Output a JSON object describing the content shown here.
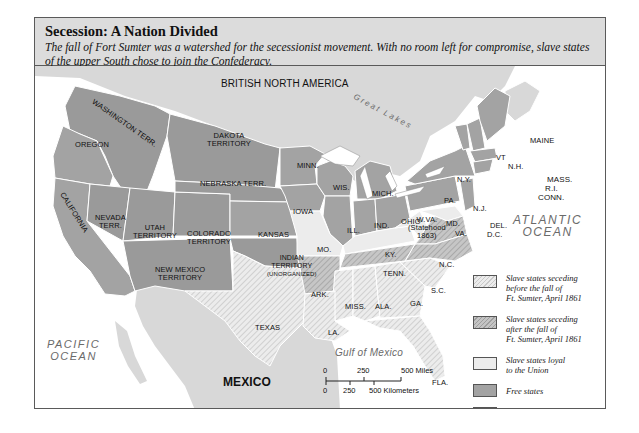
{
  "header": {
    "title": "Secession: A Nation Divided",
    "subtitle": "The fall of Fort Sumter was a watershed for the secessionist movement. With no room left for compromise, slave states of the upper South chose to join the Confederacy."
  },
  "regions": {
    "british_north_america": "BRITISH NORTH AMERICA",
    "great_lakes": "Great Lakes",
    "mexico": "MEXICO",
    "pacific_ocean": [
      "PACIFIC",
      "OCEAN"
    ],
    "atlantic_ocean": [
      "ATLANTIC",
      "OCEAN"
    ],
    "gulf_of_mexico": "Gulf of Mexico"
  },
  "states": {
    "washington": "WASHINGTON TERR.",
    "oregon": "OREGON",
    "california": "CALIFORNIA",
    "nevada": [
      "NEVADA",
      "TERR."
    ],
    "utah": [
      "UTAH",
      "TERRITORY"
    ],
    "colorado": [
      "COLORADO",
      "TERRITORY"
    ],
    "dakota": [
      "DAKOTA",
      "TERRITORY"
    ],
    "nebraska": "NEBRASKA TERR.",
    "kansas": "KANSAS",
    "new_mexico": [
      "NEW MEXICO",
      "TERRITORY"
    ],
    "indian": [
      "INDIAN",
      "TERRITORY",
      "(UNORGANIZED)"
    ],
    "texas": "TEXAS",
    "minn": "MINN.",
    "iowa": "IOWA",
    "mo": "MO.",
    "ark": "ARK.",
    "la": "LA.",
    "wis": "WIS.",
    "ill": "ILL.",
    "mich": "MICH.",
    "ind": "IND.",
    "ohio": "OHIO",
    "ky": "KY.",
    "tenn": "TENN.",
    "miss": "MISS.",
    "ala": "ALA.",
    "ga": "GA.",
    "fla": "FLA.",
    "sc": "S.C.",
    "nc": "N.C.",
    "va": "VA.",
    "wva": [
      "W.VA.",
      "(Statehood",
      "1863)"
    ],
    "md": "MD.",
    "del": "DEL.",
    "dc": "D.C.",
    "pa": "PA.",
    "nj": "N.J.",
    "ny": "N.Y.",
    "vt": "VT",
    "nh": "N.H.",
    "maine": "MAINE",
    "mass": "MASS.",
    "ri": "R.I.",
    "conn": "CONN."
  },
  "legend": {
    "items": [
      {
        "label": "Slave states seceding before the fall of Ft. Sumter, April 1861",
        "lines": [
          "Slave states seceding",
          "before the fall of",
          "Ft. Sumter, April 1861"
        ],
        "pattern": "light-hatch"
      },
      {
        "label": "Slave states seceding after the fall of Ft. Sumter, April 1861",
        "lines": [
          "Slave states seceding",
          "after the fall of",
          "Ft. Sumter, April 1861"
        ],
        "pattern": "dark-hatch"
      },
      {
        "label": "Slave states loyal to the Union",
        "lines": [
          "Slave states loyal",
          "to the Union"
        ],
        "pattern": "light-solid"
      },
      {
        "label": "Free states",
        "lines": [
          "Free states"
        ],
        "pattern": "gray-solid"
      },
      {
        "label": "Free territories",
        "lines": [
          "Free territories"
        ],
        "pattern": "gray-solid"
      }
    ]
  },
  "scale": {
    "miles": [
      "0",
      "250",
      "500 Miles"
    ],
    "km": [
      "0",
      "250",
      "500 Kilometers"
    ]
  },
  "colors": {
    "free": "#a3a3a3",
    "territory": "#9a9a9a",
    "loyal_slave": "#ececec",
    "foreign_land": "#d8d8d8",
    "water": "#ffffff",
    "header_bg": "#dcdcdc"
  }
}
